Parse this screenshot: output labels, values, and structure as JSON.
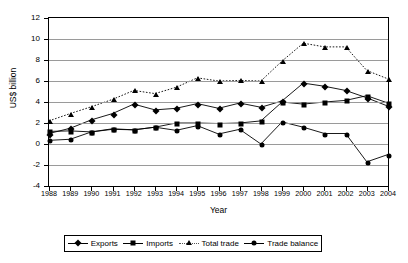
{
  "chart_data": {
    "type": "line",
    "title": "",
    "xlabel": "Year",
    "ylabel": "US$ billion",
    "x": [
      1988,
      1989,
      1990,
      1991,
      1992,
      1993,
      1994,
      1995,
      1996,
      1997,
      1998,
      1999,
      2000,
      2001,
      2002,
      2003,
      2004
    ],
    "categories": [
      "1988",
      "1989",
      "1990",
      "1991",
      "1992",
      "1993",
      "1994",
      "1995",
      "1996",
      "1997",
      "1998",
      "1999",
      "2000",
      "2001",
      "2002",
      "2003",
      "2004"
    ],
    "xlim": [
      1988,
      2004
    ],
    "ylim": [
      -4,
      12
    ],
    "yticks": [
      -4,
      -2,
      0,
      2,
      4,
      6,
      8,
      10,
      12
    ],
    "ytick_labels": [
      "-4",
      "-2",
      "0",
      "2",
      "4",
      "6",
      "8",
      "10",
      "12"
    ],
    "grid": "horizontal",
    "legend_position": "bottom",
    "series": [
      {
        "name": "Exports",
        "marker": "diamond",
        "linestyle": "solid",
        "color": "#000000",
        "values": [
          1.0,
          1.5,
          2.3,
          2.9,
          3.8,
          3.25,
          3.4,
          3.85,
          3.4,
          3.9,
          3.5,
          4.1,
          5.8,
          5.5,
          5.1,
          4.4,
          3.6
        ]
      },
      {
        "name": "Imports",
        "marker": "square",
        "linestyle": "solid",
        "color": "#000000",
        "values": [
          1.2,
          1.25,
          1.15,
          1.4,
          1.35,
          1.6,
          2.0,
          2.0,
          1.95,
          2.0,
          2.2,
          4.0,
          3.8,
          4.0,
          4.15,
          4.6,
          3.9
        ]
      },
      {
        "name": "Total trade",
        "marker": "triangle",
        "linestyle": "dotted",
        "color": "#000000",
        "values": [
          2.2,
          2.9,
          3.55,
          4.25,
          5.1,
          4.8,
          5.4,
          6.3,
          6.0,
          6.05,
          6.0,
          7.9,
          9.6,
          9.25,
          9.25,
          7.0,
          6.2
        ]
      },
      {
        "name": "Trade balance",
        "marker": "circle",
        "linestyle": "solid",
        "color": "#000000",
        "values": [
          0.35,
          0.45,
          1.15,
          1.45,
          1.35,
          1.6,
          1.3,
          1.75,
          0.95,
          1.4,
          0.0,
          2.1,
          1.6,
          1.0,
          1.0,
          -1.7,
          -1.0
        ]
      }
    ]
  },
  "axes": {
    "ylabel": "US$ billion",
    "xlabel": "Year"
  },
  "legend": {
    "items": [
      {
        "label": "Exports",
        "marker": "diamond",
        "style": "solid"
      },
      {
        "label": "Imports",
        "marker": "square",
        "style": "solid"
      },
      {
        "label": "Total trade",
        "marker": "triangle",
        "style": "dotted"
      },
      {
        "label": "Trade balance",
        "marker": "circle",
        "style": "solid"
      }
    ]
  }
}
